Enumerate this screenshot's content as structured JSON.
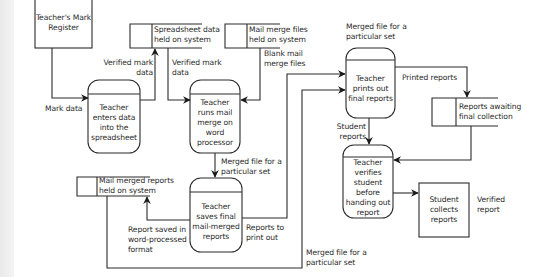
{
  "diagram": {
    "type": "data-flow-diagram",
    "external_entities": [
      {
        "id": "mark-register",
        "label": "Teacher's Mark Register"
      },
      {
        "id": "student-collects",
        "label": "Student collects reports"
      }
    ],
    "processes": [
      {
        "id": "p1",
        "label": "Teacher enters data into the spreadsheet"
      },
      {
        "id": "p2",
        "label": "Teacher runs mail merge on word processor"
      },
      {
        "id": "p3",
        "label": "Teacher prints out final reports"
      },
      {
        "id": "p4",
        "label": "Teacher saves final mail-merged reports"
      },
      {
        "id": "p5",
        "label": "Teacher verifies student before handing out report"
      }
    ],
    "data_stores": [
      {
        "id": "s1",
        "line1": "Spreadsheet data",
        "line2": "held on system"
      },
      {
        "id": "s2",
        "line1": "Mail merge files",
        "line2": "held on system"
      },
      {
        "id": "s3",
        "line1": "Mail merged reports",
        "line2": "held on system"
      },
      {
        "id": "s4",
        "line1": "Reports awaiting",
        "line2": "final collection"
      }
    ],
    "flows": {
      "mark_data": "Mark data",
      "verified_mark_data_1a": "Verified mark",
      "verified_mark_data_1b": "data",
      "verified_mark_data_2a": "Verified mark",
      "verified_mark_data_2b": "data",
      "blank_merge_a": "Blank mail",
      "blank_merge_b": "merge files",
      "merged_p2_p4_a": "Merged file for a",
      "merged_p2_p4_b": "particular set",
      "merged_top_a": "Merged file for a",
      "merged_top_b": "particular set",
      "printed_reports": "Printed reports",
      "student_reports_a": "Student",
      "student_reports_b": "reports",
      "report_saved_a": "Report saved in",
      "report_saved_b": "word-processed",
      "report_saved_c": "format",
      "reports_print_a": "Reports to",
      "reports_print_b": "print out",
      "merged_bottom_a": "Merged file for a",
      "merged_bottom_b": "particular set",
      "verified_report_a": "Verified",
      "verified_report_b": "report"
    }
  }
}
